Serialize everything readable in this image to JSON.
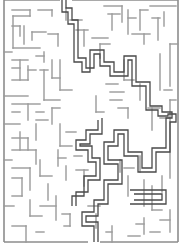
{
  "maze": {
    "width": 186,
    "height": 247,
    "colors": {
      "background": "#ffffff",
      "wall": "#9a9a9a",
      "solution": "#4a4a4a"
    },
    "border": {
      "x1": 4,
      "y1": 0,
      "x2": 178,
      "y2": 242,
      "entrance_gap": [
        60,
        72
      ],
      "exit_gap": [
        88,
        100
      ]
    },
    "walls": [
      [
        12,
        10,
        30,
        10
      ],
      [
        13,
        16,
        13,
        48
      ],
      [
        13,
        16,
        30,
        16
      ],
      [
        30,
        10,
        30,
        16
      ],
      [
        38,
        10,
        52,
        10
      ],
      [
        52,
        10,
        52,
        16
      ],
      [
        12,
        26,
        20,
        26
      ],
      [
        20,
        26,
        20,
        36
      ],
      [
        13,
        48,
        40,
        48
      ],
      [
        24,
        26,
        24,
        44
      ],
      [
        32,
        32,
        46,
        32
      ],
      [
        32,
        32,
        32,
        40
      ],
      [
        48,
        34,
        58,
        34
      ],
      [
        58,
        34,
        58,
        46
      ],
      [
        4,
        52,
        12,
        52
      ],
      [
        12,
        60,
        28,
        60
      ],
      [
        20,
        60,
        20,
        80
      ],
      [
        12,
        68,
        20,
        68
      ],
      [
        12,
        80,
        28,
        80
      ],
      [
        28,
        66,
        28,
        80
      ],
      [
        28,
        70,
        36,
        70
      ],
      [
        36,
        56,
        44,
        56
      ],
      [
        44,
        52,
        44,
        62
      ],
      [
        40,
        70,
        48,
        70
      ],
      [
        44,
        70,
        44,
        100
      ],
      [
        52,
        60,
        52,
        78
      ],
      [
        52,
        78,
        60,
        78
      ],
      [
        4,
        96,
        28,
        96
      ],
      [
        12,
        104,
        40,
        104
      ],
      [
        28,
        104,
        28,
        120
      ],
      [
        12,
        112,
        20,
        112
      ],
      [
        4,
        124,
        20,
        124
      ],
      [
        36,
        112,
        44,
        112
      ],
      [
        44,
        100,
        60,
        100
      ],
      [
        52,
        108,
        60,
        108
      ],
      [
        52,
        108,
        52,
        124
      ],
      [
        36,
        120,
        48,
        120
      ],
      [
        36,
        124,
        36,
        140
      ],
      [
        60,
        60,
        60,
        90
      ],
      [
        60,
        90,
        72,
        90
      ],
      [
        66,
        8,
        66,
        20
      ],
      [
        70,
        20,
        82,
        20
      ],
      [
        76,
        30,
        88,
        30
      ],
      [
        84,
        30,
        84,
        46
      ],
      [
        92,
        38,
        108,
        38
      ],
      [
        100,
        44,
        110,
        44
      ],
      [
        100,
        44,
        100,
        58
      ],
      [
        104,
        6,
        122,
        6
      ],
      [
        122,
        6,
        122,
        22
      ],
      [
        108,
        14,
        120,
        14
      ],
      [
        112,
        14,
        112,
        30
      ],
      [
        128,
        10,
        128,
        34
      ],
      [
        128,
        18,
        136,
        18
      ],
      [
        140,
        10,
        148,
        10
      ],
      [
        140,
        10,
        140,
        30
      ],
      [
        150,
        6,
        176,
        6
      ],
      [
        152,
        18,
        160,
        18
      ],
      [
        158,
        18,
        158,
        40
      ],
      [
        164,
        12,
        164,
        26
      ],
      [
        132,
        34,
        150,
        34
      ],
      [
        144,
        34,
        144,
        44
      ],
      [
        170,
        44,
        178,
        44
      ],
      [
        170,
        44,
        170,
        86
      ],
      [
        160,
        54,
        160,
        90
      ],
      [
        164,
        90,
        172,
        90
      ],
      [
        124,
        60,
        124,
        80
      ],
      [
        124,
        80,
        134,
        80
      ],
      [
        140,
        84,
        140,
        100
      ],
      [
        106,
        84,
        118,
        84
      ],
      [
        110,
        92,
        124,
        92
      ],
      [
        110,
        100,
        122,
        100
      ],
      [
        96,
        96,
        96,
        112
      ],
      [
        96,
        112,
        104,
        112
      ],
      [
        118,
        108,
        128,
        108
      ],
      [
        128,
        108,
        128,
        118
      ],
      [
        148,
        108,
        160,
        108
      ],
      [
        152,
        108,
        152,
        130
      ],
      [
        160,
        118,
        170,
        118
      ],
      [
        170,
        100,
        170,
        178
      ],
      [
        176,
        100,
        170,
        100
      ],
      [
        60,
        124,
        60,
        146
      ],
      [
        60,
        146,
        72,
        146
      ],
      [
        66,
        132,
        76,
        132
      ],
      [
        12,
        138,
        28,
        138
      ],
      [
        28,
        138,
        28,
        150
      ],
      [
        12,
        150,
        36,
        150
      ],
      [
        20,
        132,
        20,
        150
      ],
      [
        36,
        150,
        36,
        164
      ],
      [
        4,
        160,
        12,
        160
      ],
      [
        12,
        168,
        30,
        168
      ],
      [
        30,
        168,
        30,
        190
      ],
      [
        40,
        160,
        40,
        176
      ],
      [
        40,
        176,
        52,
        176
      ],
      [
        48,
        184,
        48,
        200
      ],
      [
        58,
        150,
        58,
        166
      ],
      [
        58,
        158,
        66,
        158
      ],
      [
        66,
        166,
        66,
        180
      ],
      [
        74,
        156,
        82,
        156
      ],
      [
        76,
        170,
        88,
        170
      ],
      [
        84,
        170,
        84,
        186
      ],
      [
        12,
        178,
        22,
        178
      ],
      [
        22,
        178,
        22,
        196
      ],
      [
        4,
        206,
        14,
        206
      ],
      [
        12,
        196,
        22,
        196
      ],
      [
        30,
        200,
        30,
        216
      ],
      [
        30,
        216,
        42,
        216
      ],
      [
        40,
        206,
        56,
        206
      ],
      [
        56,
        196,
        56,
        220
      ],
      [
        12,
        226,
        26,
        226
      ],
      [
        26,
        226,
        26,
        242
      ],
      [
        36,
        232,
        44,
        232
      ],
      [
        62,
        214,
        70,
        214
      ],
      [
        70,
        214,
        70,
        226
      ],
      [
        64,
        226,
        70,
        226
      ],
      [
        88,
        206,
        100,
        206
      ],
      [
        96,
        214,
        96,
        228
      ],
      [
        106,
        232,
        112,
        232
      ],
      [
        112,
        226,
        112,
        242
      ],
      [
        120,
        160,
        120,
        172
      ],
      [
        124,
        168,
        134,
        168
      ],
      [
        128,
        176,
        128,
        196
      ],
      [
        140,
        156,
        140,
        172
      ],
      [
        144,
        180,
        144,
        206
      ],
      [
        152,
        186,
        152,
        210
      ],
      [
        152,
        210,
        162,
        210
      ],
      [
        162,
        176,
        162,
        192
      ],
      [
        160,
        220,
        170,
        220
      ],
      [
        170,
        210,
        170,
        232
      ],
      [
        136,
        224,
        144,
        224
      ],
      [
        144,
        218,
        144,
        234
      ],
      [
        128,
        236,
        140,
        236
      ],
      [
        150,
        232,
        160,
        232
      ]
    ],
    "solution_path": [
      [
        [
          62,
          0
        ],
        [
          62,
          12
        ],
        [
          68,
          12
        ],
        [
          68,
          24
        ],
        [
          74,
          24
        ],
        [
          74,
          62
        ],
        [
          82,
          62
        ],
        [
          82,
          72
        ],
        [
          90,
          72
        ],
        [
          90,
          50
        ],
        [
          104,
          50
        ],
        [
          104,
          62
        ],
        [
          114,
          62
        ],
        [
          114,
          72
        ],
        [
          124,
          72
        ],
        [
          124,
          56
        ],
        [
          136,
          56
        ],
        [
          136,
          82
        ],
        [
          150,
          82
        ],
        [
          150,
          106
        ],
        [
          162,
          106
        ],
        [
          162,
          112
        ],
        [
          172,
          112
        ],
        [
          172,
          118
        ],
        [
          166,
          118
        ],
        [
          166,
          148
        ],
        [
          152,
          148
        ],
        [
          152,
          168
        ],
        [
          142,
          168
        ],
        [
          142,
          152
        ],
        [
          128,
          152
        ],
        [
          128,
          130
        ],
        [
          114,
          130
        ],
        [
          114,
          142
        ],
        [
          104,
          142
        ],
        [
          104,
          164
        ],
        [
          118,
          164
        ],
        [
          118,
          180
        ],
        [
          104,
          180
        ],
        [
          104,
          200
        ],
        [
          94,
          200
        ],
        [
          94,
          212
        ],
        [
          82,
          212
        ],
        [
          82,
          226
        ],
        [
          94,
          226
        ],
        [
          94,
          242
        ]
      ],
      [
        [
          66,
          0
        ],
        [
          66,
          8
        ],
        [
          72,
          8
        ],
        [
          72,
          20
        ],
        [
          78,
          20
        ],
        [
          78,
          58
        ],
        [
          86,
          58
        ],
        [
          86,
          68
        ],
        [
          86,
          68
        ],
        [
          94,
          68
        ],
        [
          94,
          54
        ],
        [
          100,
          54
        ],
        [
          100,
          66
        ],
        [
          110,
          66
        ],
        [
          110,
          76
        ],
        [
          128,
          76
        ],
        [
          128,
          60
        ],
        [
          132,
          60
        ],
        [
          132,
          86
        ],
        [
          146,
          86
        ],
        [
          146,
          110
        ],
        [
          158,
          110
        ],
        [
          158,
          116
        ],
        [
          168,
          116
        ],
        [
          168,
          114
        ],
        [
          176,
          114
        ],
        [
          176,
          122
        ],
        [
          170,
          122
        ],
        [
          170,
          152
        ],
        [
          156,
          152
        ],
        [
          156,
          172
        ],
        [
          138,
          172
        ],
        [
          138,
          156
        ],
        [
          124,
          156
        ],
        [
          124,
          134
        ],
        [
          118,
          134
        ],
        [
          118,
          146
        ],
        [
          108,
          146
        ],
        [
          108,
          160
        ],
        [
          122,
          160
        ],
        [
          122,
          184
        ],
        [
          108,
          184
        ],
        [
          108,
          204
        ],
        [
          98,
          204
        ],
        [
          98,
          216
        ],
        [
          86,
          216
        ],
        [
          86,
          222
        ],
        [
          98,
          222
        ],
        [
          98,
          242
        ]
      ],
      [
        [
          98,
          120
        ],
        [
          98,
          130
        ],
        [
          86,
          130
        ],
        [
          86,
          140
        ],
        [
          76,
          140
        ],
        [
          76,
          150
        ],
        [
          88,
          150
        ],
        [
          88,
          162
        ],
        [
          96,
          162
        ],
        [
          96,
          176
        ],
        [
          84,
          176
        ],
        [
          84,
          196
        ],
        [
          72,
          196
        ],
        [
          72,
          206
        ]
      ],
      [
        [
          102,
          118
        ],
        [
          102,
          134
        ],
        [
          90,
          134
        ],
        [
          90,
          144
        ],
        [
          80,
          144
        ],
        [
          80,
          146
        ],
        [
          92,
          146
        ],
        [
          92,
          158
        ],
        [
          100,
          158
        ],
        [
          100,
          180
        ],
        [
          88,
          180
        ],
        [
          88,
          192
        ],
        [
          76,
          192
        ],
        [
          76,
          206
        ]
      ],
      [
        [
          130,
          190
        ],
        [
          166,
          190
        ],
        [
          166,
          204
        ],
        [
          130,
          204
        ]
      ],
      [
        [
          134,
          194
        ],
        [
          162,
          194
        ],
        [
          162,
          200
        ],
        [
          134,
          200
        ]
      ]
    ]
  }
}
